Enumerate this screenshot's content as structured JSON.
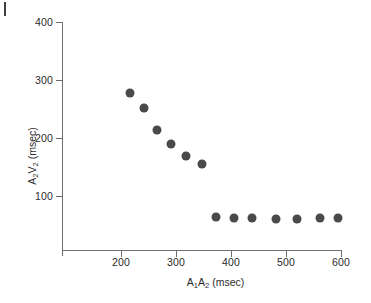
{
  "figure": {
    "corner_mark": "page-edge-artifact"
  },
  "chart_data": {
    "type": "scatter",
    "title": "",
    "xlabel": "A₁A₂ (msec)",
    "ylabel": "A₂V₂ (msec)",
    "xlabel_parts": {
      "a": "A",
      "sub1": "1",
      "b": "A",
      "sub2": "2",
      "units": " (msec)"
    },
    "ylabel_parts": {
      "a": "A",
      "sub1": "2",
      "v": "V",
      "sub2": "2",
      "units": " (msec)"
    },
    "xlim": [
      110,
      620
    ],
    "ylim": [
      0,
      400
    ],
    "xticks": [
      200,
      300,
      400,
      500,
      600
    ],
    "yticks": [
      100,
      200,
      300,
      400
    ],
    "xtick_labels": [
      "200",
      "300",
      "400",
      "500",
      "600"
    ],
    "ytick_labels": [
      "100",
      "200",
      "300",
      "400"
    ],
    "grid": false,
    "legend": "none",
    "marker": {
      "shape": "circle",
      "color": "#4a4a4a",
      "size": 9
    },
    "series": [
      {
        "name": "A2V2 conduction curve",
        "points": [
          {
            "x": 217,
            "y": 278
          },
          {
            "x": 242,
            "y": 251
          },
          {
            "x": 265,
            "y": 214
          },
          {
            "x": 290,
            "y": 189
          },
          {
            "x": 318,
            "y": 169
          },
          {
            "x": 348,
            "y": 155
          },
          {
            "x": 373,
            "y": 64
          },
          {
            "x": 405,
            "y": 62
          },
          {
            "x": 438,
            "y": 62
          },
          {
            "x": 482,
            "y": 61
          },
          {
            "x": 520,
            "y": 61
          },
          {
            "x": 562,
            "y": 62
          },
          {
            "x": 595,
            "y": 63
          }
        ]
      }
    ]
  }
}
